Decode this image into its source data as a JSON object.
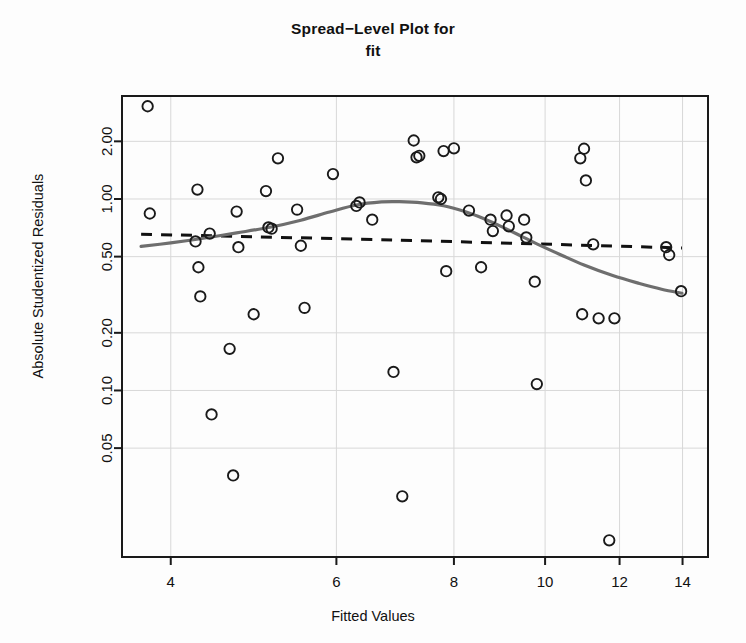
{
  "title": {
    "line1": "Spread−Level Plot for",
    "line2": "fit"
  },
  "axis_labels": {
    "x": "Fitted Values",
    "y": "Absolute Studentized Residuals"
  },
  "colors": {
    "frame": "#1a1a1a",
    "grid": "#d8d8d8",
    "point_stroke": "#1a1a1a",
    "smooth_curve": "#6e6e6e",
    "reference_line": "#111111",
    "background": "#fdfdfd"
  },
  "chart_data": {
    "type": "scatter",
    "title": "Spread−Level Plot for fit",
    "xlabel": "Fitted Values",
    "ylabel": "Absolute Studentized Residuals",
    "xscale": "log",
    "yscale": "log",
    "xlim": [
      3.55,
      14.9
    ],
    "ylim": [
      0.0135,
      3.45
    ],
    "grid": true,
    "legend": "none",
    "xticks": [
      4,
      6,
      8,
      10,
      12,
      14
    ],
    "xticklabels": [
      "4",
      "6",
      "8",
      "10",
      "12",
      "14"
    ],
    "yticks": [
      0.05,
      0.1,
      0.2,
      0.5,
      1.0,
      2.0
    ],
    "yticklabels": [
      "0.05",
      "0.10",
      "0.20",
      "0.50",
      "1.00",
      "2.00"
    ],
    "points": [
      {
        "x": 3.78,
        "y": 3.05
      },
      {
        "x": 3.8,
        "y": 0.84
      },
      {
        "x": 4.27,
        "y": 1.12
      },
      {
        "x": 4.25,
        "y": 0.6
      },
      {
        "x": 4.28,
        "y": 0.44
      },
      {
        "x": 4.3,
        "y": 0.31
      },
      {
        "x": 4.4,
        "y": 0.66
      },
      {
        "x": 4.42,
        "y": 0.075
      },
      {
        "x": 4.62,
        "y": 0.165
      },
      {
        "x": 4.66,
        "y": 0.036
      },
      {
        "x": 4.7,
        "y": 0.86
      },
      {
        "x": 4.72,
        "y": 0.56
      },
      {
        "x": 4.9,
        "y": 0.25
      },
      {
        "x": 5.05,
        "y": 1.1
      },
      {
        "x": 5.08,
        "y": 0.71
      },
      {
        "x": 5.12,
        "y": 0.7
      },
      {
        "x": 5.2,
        "y": 1.63
      },
      {
        "x": 5.45,
        "y": 0.88
      },
      {
        "x": 5.5,
        "y": 0.57
      },
      {
        "x": 5.55,
        "y": 0.27
      },
      {
        "x": 5.95,
        "y": 1.35
      },
      {
        "x": 6.3,
        "y": 0.92
      },
      {
        "x": 6.35,
        "y": 0.96
      },
      {
        "x": 6.55,
        "y": 0.78
      },
      {
        "x": 6.9,
        "y": 0.125
      },
      {
        "x": 7.05,
        "y": 0.028
      },
      {
        "x": 7.25,
        "y": 2.02
      },
      {
        "x": 7.3,
        "y": 1.65
      },
      {
        "x": 7.35,
        "y": 1.68
      },
      {
        "x": 7.7,
        "y": 1.02
      },
      {
        "x": 7.75,
        "y": 1.0
      },
      {
        "x": 7.8,
        "y": 1.78
      },
      {
        "x": 7.85,
        "y": 0.42
      },
      {
        "x": 8.0,
        "y": 1.84
      },
      {
        "x": 8.3,
        "y": 0.87
      },
      {
        "x": 8.55,
        "y": 0.44
      },
      {
        "x": 8.75,
        "y": 0.78
      },
      {
        "x": 8.8,
        "y": 0.68
      },
      {
        "x": 9.1,
        "y": 0.82
      },
      {
        "x": 9.15,
        "y": 0.72
      },
      {
        "x": 9.5,
        "y": 0.78
      },
      {
        "x": 9.55,
        "y": 0.63
      },
      {
        "x": 9.75,
        "y": 0.37
      },
      {
        "x": 9.8,
        "y": 0.108
      },
      {
        "x": 10.9,
        "y": 1.63
      },
      {
        "x": 10.95,
        "y": 0.25
      },
      {
        "x": 11.0,
        "y": 1.83
      },
      {
        "x": 11.05,
        "y": 1.25
      },
      {
        "x": 11.25,
        "y": 0.58
      },
      {
        "x": 11.4,
        "y": 0.238
      },
      {
        "x": 11.7,
        "y": 0.0165
      },
      {
        "x": 11.85,
        "y": 0.238
      },
      {
        "x": 13.45,
        "y": 0.56
      },
      {
        "x": 13.55,
        "y": 0.51
      },
      {
        "x": 13.95,
        "y": 0.33
      }
    ],
    "smooth_curve": {
      "name": "loess smooth",
      "style": "solid",
      "color": "#6e6e6e",
      "x": [
        3.72,
        4.0,
        4.3,
        4.7,
        5.1,
        5.5,
        5.9,
        6.3,
        6.7,
        7.0,
        7.4,
        7.8,
        8.2,
        8.6,
        9.0,
        9.4,
        9.8,
        10.4,
        11.0,
        11.8,
        12.6,
        13.3,
        13.98
      ],
      "y": [
        0.565,
        0.59,
        0.62,
        0.665,
        0.712,
        0.775,
        0.855,
        0.93,
        0.965,
        0.968,
        0.955,
        0.922,
        0.862,
        0.79,
        0.715,
        0.645,
        0.583,
        0.51,
        0.452,
        0.398,
        0.362,
        0.338,
        0.322
      ]
    },
    "reference_line": {
      "name": "robust reference line",
      "style": "dashed",
      "color": "#111111",
      "x": [
        3.72,
        6.9,
        13.98
      ],
      "y": [
        0.655,
        0.61,
        0.555
      ]
    }
  }
}
